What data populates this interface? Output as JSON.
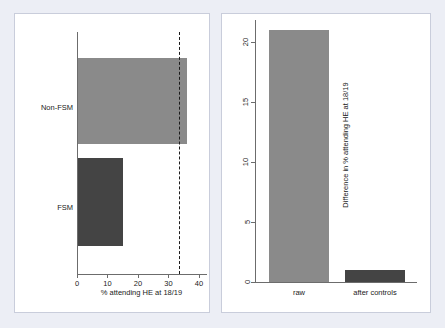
{
  "chart_data": [
    {
      "type": "bar",
      "orientation": "horizontal",
      "panel": "left",
      "title": "",
      "categories": [
        "Non-FSM",
        "FSM"
      ],
      "values": [
        36.2,
        15.2
      ],
      "xlabel": "% attending HE at 18/19",
      "ylabel": "",
      "xlim": [
        0,
        42
      ],
      "xticks": [
        0,
        10,
        20,
        30,
        40
      ],
      "xticklabels": [
        "0",
        "10",
        "20",
        "30",
        "40"
      ],
      "grid": false,
      "bar_colors": [
        "#8a8a8a",
        "#444444"
      ],
      "annotations": [
        {
          "type": "vline",
          "value": 33.5,
          "style": "dashed",
          "color": "#1b1b1b"
        }
      ]
    },
    {
      "type": "bar",
      "orientation": "vertical",
      "panel": "right",
      "title": "",
      "categories": [
        "raw",
        "after controls"
      ],
      "values": [
        21.0,
        1.0
      ],
      "xlabel": "",
      "ylabel": "Difference in % attending HE at 18/19",
      "ylim": [
        0,
        21.8
      ],
      "yticks": [
        0,
        5,
        10,
        15,
        20
      ],
      "yticklabels": [
        "0",
        "5",
        "10",
        "15",
        "20"
      ],
      "grid": false,
      "bar_colors": [
        "#8a8a8a",
        "#444444"
      ]
    }
  ],
  "style": {
    "background": "#eceef5",
    "panel_background": "#ffffff",
    "panel_border": "#c9cddb",
    "axis_color": "#6c6c6c",
    "text_color": "#1b1b1b",
    "light_bar": "#8a8a8a",
    "dark_bar": "#444444"
  }
}
